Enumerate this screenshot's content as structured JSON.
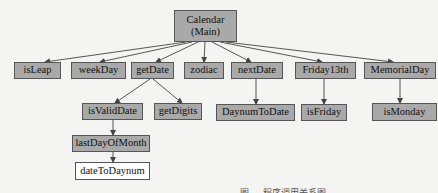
{
  "diagram": {
    "type": "call-hierarchy",
    "colors": {
      "node_fill": "#a9a9a9",
      "leaf_fill": "#ffffff",
      "edge": "#444444",
      "background": "#f4f4f2"
    },
    "nodes": [
      {
        "id": "calendar",
        "label_line1": "Calendar",
        "label_line2": "(Main)",
        "x": 174,
        "y": 10,
        "w": 63,
        "h": 32,
        "fill": "gray"
      },
      {
        "id": "isLeap",
        "label": "isLeap",
        "x": 14,
        "y": 62,
        "w": 47,
        "h": 17,
        "fill": "gray"
      },
      {
        "id": "weekDay",
        "label": "weekDay",
        "x": 71,
        "y": 62,
        "w": 55,
        "h": 17,
        "fill": "gray"
      },
      {
        "id": "getDate",
        "label": "getDate",
        "x": 131,
        "y": 62,
        "w": 43,
        "h": 17,
        "fill": "gray"
      },
      {
        "id": "zodiac",
        "label": "zodiac",
        "x": 184,
        "y": 62,
        "w": 40,
        "h": 17,
        "fill": "gray"
      },
      {
        "id": "nextDate",
        "label": "nextDate",
        "x": 231,
        "y": 62,
        "w": 52,
        "h": 17,
        "fill": "gray"
      },
      {
        "id": "friday13th",
        "label": "Friday13th",
        "x": 295,
        "y": 62,
        "w": 61,
        "h": 17,
        "fill": "gray"
      },
      {
        "id": "memorialDay",
        "label": "MemorialDay",
        "x": 364,
        "y": 62,
        "w": 72,
        "h": 17,
        "fill": "gray"
      },
      {
        "id": "isValidDate",
        "label": "isValidDate",
        "x": 82,
        "y": 103,
        "w": 61,
        "h": 17,
        "fill": "gray"
      },
      {
        "id": "getDigits",
        "label": "getDigits",
        "x": 154,
        "y": 103,
        "w": 48,
        "h": 17,
        "fill": "gray"
      },
      {
        "id": "daynumToDate",
        "label": "DaynumToDate",
        "x": 216,
        "y": 104,
        "w": 79,
        "h": 17,
        "fill": "gray"
      },
      {
        "id": "isFriday",
        "label": "isFriday",
        "x": 301,
        "y": 104,
        "w": 46,
        "h": 17,
        "fill": "gray"
      },
      {
        "id": "isMonday",
        "label": "isMonday",
        "x": 372,
        "y": 103,
        "w": 65,
        "h": 18,
        "fill": "gray"
      },
      {
        "id": "lastDayOfMonth",
        "label": "lastDayOfMonth",
        "x": 72,
        "y": 135,
        "w": 78,
        "h": 17,
        "fill": "gray"
      },
      {
        "id": "dateToDaynum",
        "label": "dateToDaynum",
        "x": 75,
        "y": 162,
        "w": 75,
        "h": 18,
        "fill": "white"
      }
    ],
    "edges": [
      {
        "from": "calendar",
        "to": "isLeap",
        "x1": 186,
        "y1": 42,
        "x2": 45,
        "y2": 62
      },
      {
        "from": "calendar",
        "to": "weekDay",
        "x1": 192,
        "y1": 42,
        "x2": 100,
        "y2": 62
      },
      {
        "from": "calendar",
        "to": "getDate",
        "x1": 198,
        "y1": 42,
        "x2": 156,
        "y2": 62
      },
      {
        "from": "calendar",
        "to": "zodiac",
        "x1": 205,
        "y1": 42,
        "x2": 204,
        "y2": 62
      },
      {
        "from": "calendar",
        "to": "nextDate",
        "x1": 212,
        "y1": 42,
        "x2": 251,
        "y2": 62
      },
      {
        "from": "calendar",
        "to": "friday13th",
        "x1": 220,
        "y1": 42,
        "x2": 322,
        "y2": 62
      },
      {
        "from": "calendar",
        "to": "memorialDay",
        "x1": 226,
        "y1": 42,
        "x2": 393,
        "y2": 62
      },
      {
        "from": "getDate",
        "to": "isValidDate",
        "x1": 150,
        "y1": 79,
        "x2": 115,
        "y2": 103
      },
      {
        "from": "getDate",
        "to": "getDigits",
        "x1": 153,
        "y1": 79,
        "x2": 182,
        "y2": 103
      },
      {
        "from": "nextDate",
        "to": "daynumToDate",
        "x1": 256,
        "y1": 79,
        "x2": 256,
        "y2": 104
      },
      {
        "from": "friday13th",
        "to": "isFriday",
        "x1": 324,
        "y1": 79,
        "x2": 324,
        "y2": 104
      },
      {
        "from": "memorialDay",
        "to": "isMonday",
        "x1": 400,
        "y1": 79,
        "x2": 400,
        "y2": 103
      },
      {
        "from": "isValidDate",
        "to": "lastDayOfMonth",
        "x1": 113,
        "y1": 120,
        "x2": 113,
        "y2": 135
      },
      {
        "from": "lastDayOfMonth",
        "to": "dateToDaynum",
        "x1": 113,
        "y1": 152,
        "x2": 113,
        "y2": 162
      }
    ]
  },
  "caption": "图 … 程序调用关系图"
}
